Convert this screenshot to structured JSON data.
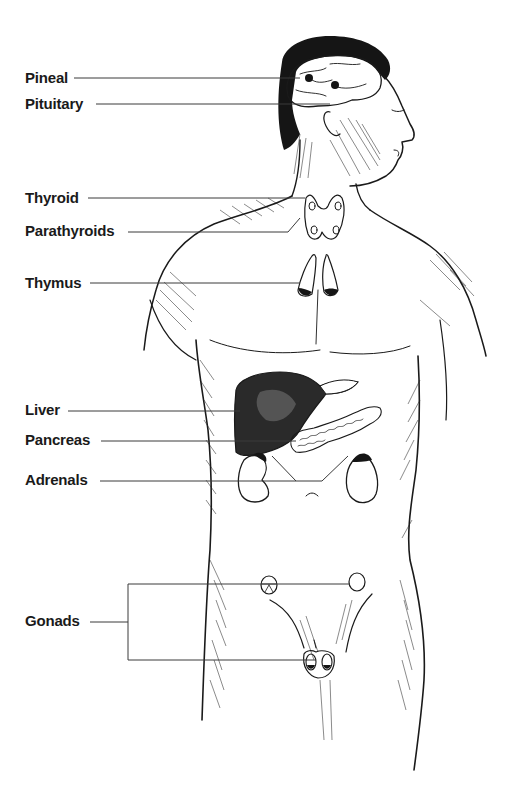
{
  "figure": {
    "ink_color": "#1a1a1a",
    "background": "#ffffff"
  },
  "labels": [
    {
      "id": "pineal",
      "text": "Pineal",
      "x": 25,
      "y": 70,
      "line_y": 78,
      "line_x1": 74,
      "line_x2": 300
    },
    {
      "id": "pituitary",
      "text": "Pituitary",
      "x": 25,
      "y": 96,
      "line_y": 104,
      "line_x1": 96,
      "line_x2": 330
    },
    {
      "id": "thyroid",
      "text": "Thyroid",
      "x": 25,
      "y": 190,
      "line_y": 198,
      "line_x1": 88,
      "line_x2": 305
    },
    {
      "id": "parathyroids",
      "text": "Parathyroids",
      "x": 25,
      "y": 223,
      "line_y": 232,
      "line_x1": 128,
      "line_x2": 288
    },
    {
      "id": "thymus",
      "text": "Thymus",
      "x": 25,
      "y": 275,
      "line_y": 283,
      "line_x1": 90,
      "line_x2": 300
    },
    {
      "id": "liver",
      "text": "Liver",
      "x": 25,
      "y": 402,
      "line_y": 411,
      "line_x1": 68,
      "line_x2": 240
    },
    {
      "id": "pancreas",
      "text": "Pancreas",
      "x": 25,
      "y": 432,
      "line_y": 441,
      "line_x1": 101,
      "line_x2": 300
    },
    {
      "id": "adrenals",
      "text": "Adrenals",
      "x": 25,
      "y": 472,
      "line_y": 481,
      "line_x1": 100,
      "line_x2": 295
    },
    {
      "id": "gonads",
      "text": "Gonads",
      "x": 25,
      "y": 613,
      "line_y": 622,
      "line_x1": 90,
      "line_x2": 128
    }
  ]
}
